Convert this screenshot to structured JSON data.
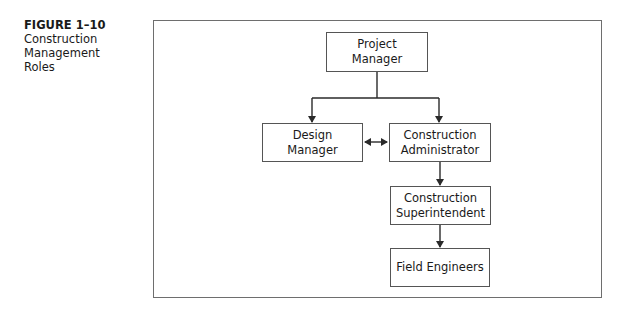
{
  "caption": {
    "figure_label": "FIGURE 1–10",
    "title_lines": [
      "Construction",
      "Management",
      "Roles"
    ]
  },
  "nodes": {
    "project_manager": {
      "label": "Project Manager"
    },
    "design_manager": {
      "label": "Design Manager"
    },
    "construction_administrator": {
      "line1": "Construction",
      "line2": "Administrator"
    },
    "construction_superintendent": {
      "line1": "Construction",
      "line2": "Superintendent"
    },
    "field_engineers": {
      "label": "Field Engineers"
    }
  },
  "edges": [
    {
      "from": "Project Manager",
      "to": "Design Manager",
      "type": "arrow"
    },
    {
      "from": "Project Manager",
      "to": "Construction Administrator",
      "type": "arrow"
    },
    {
      "from": "Design Manager",
      "to": "Construction Administrator",
      "type": "bidirectional"
    },
    {
      "from": "Construction Administrator",
      "to": "Construction Superintendent",
      "type": "arrow"
    },
    {
      "from": "Construction Superintendent",
      "to": "Field Engineers",
      "type": "arrow"
    }
  ],
  "colors": {
    "line": "#2a2a2a",
    "frame": "#6e6e6e",
    "background": "#ffffff"
  }
}
